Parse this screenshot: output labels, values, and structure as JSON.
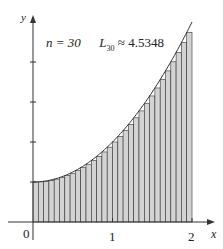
{
  "chart_data": {
    "type": "bar",
    "title": "n = 30   L30 ≈ 4.5348",
    "annotation": {
      "n_label": "n = 30",
      "sum_label": "L",
      "sum_sub": "30",
      "sum_value": "≈ 4.5348"
    },
    "function": "f(x) = x^2 + 1",
    "xlabel": "x",
    "ylabel": "y",
    "xlim": [
      0,
      2
    ],
    "ylim": [
      0,
      5
    ],
    "x_ticks": [
      "0",
      "1",
      "2"
    ],
    "y_ticks": [
      1,
      2,
      3,
      4
    ],
    "n": 30,
    "method": "left endpoint Riemann sum",
    "approximation": 4.5348,
    "grid": false,
    "legend": null,
    "colors": {
      "fill": "#d3d3d3",
      "stroke": "#333333",
      "axis": "#333333"
    }
  },
  "labels": {
    "origin": "0",
    "x1": "1",
    "x2": "2",
    "xaxis": "x",
    "yaxis": "y",
    "n_text": "n = 30",
    "L": "L",
    "L_sub": "30",
    "approx": "≈ 4.5348"
  }
}
